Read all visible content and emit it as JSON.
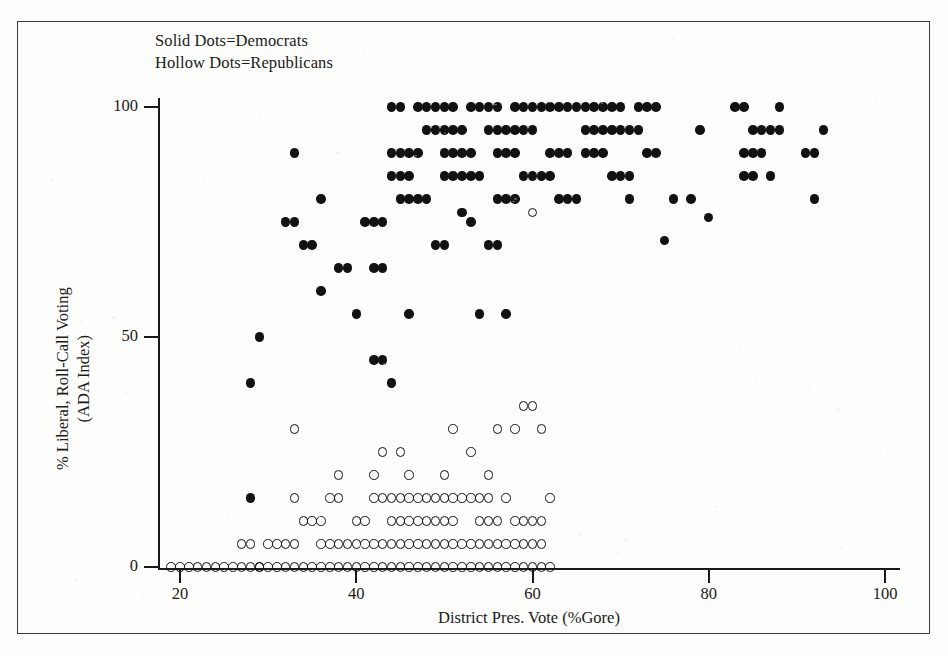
{
  "legend": {
    "line1": "Solid Dots=Democrats",
    "line2": "Hollow Dots=Republicans"
  },
  "axes": {
    "x_title": "District Pres. Vote (%Gore)",
    "y_title_line1": "% Liberal, Roll-Call Voting",
    "y_title_line2": "(ADA Index)",
    "x_ticks": [
      "20",
      "40",
      "60",
      "80",
      "100"
    ],
    "y_ticks": [
      "0",
      "50",
      "100"
    ]
  },
  "colors": {
    "ink": "#121210",
    "frame": "#3a3a38",
    "paper": "#fdfdfc"
  },
  "chart_data": {
    "type": "scatter",
    "title": "",
    "xlabel": "District Pres. Vote (%Gore)",
    "ylabel": "% Liberal, Roll-Call Voting (ADA Index)",
    "xlim": [
      17,
      102
    ],
    "ylim": [
      -4,
      106
    ],
    "xticks": [
      20,
      40,
      60,
      80,
      100
    ],
    "yticks": [
      0,
      50,
      100
    ],
    "grid": false,
    "legend_position": "top-left-inside",
    "series": [
      {
        "name": "Democrats",
        "marker": "filled-circle",
        "color": "#121210",
        "points": [
          [
            28,
            40
          ],
          [
            29,
            50
          ],
          [
            28,
            15
          ],
          [
            32,
            75
          ],
          [
            33,
            75
          ],
          [
            34,
            70
          ],
          [
            35,
            70
          ],
          [
            36,
            80
          ],
          [
            33,
            90
          ],
          [
            36,
            60
          ],
          [
            38,
            65
          ],
          [
            39,
            65
          ],
          [
            40,
            55
          ],
          [
            41,
            75
          ],
          [
            42,
            75
          ],
          [
            43,
            75
          ],
          [
            42,
            45
          ],
          [
            43,
            45
          ],
          [
            44,
            40
          ],
          [
            42,
            65
          ],
          [
            43,
            65
          ],
          [
            44,
            85
          ],
          [
            45,
            85
          ],
          [
            46,
            85
          ],
          [
            44,
            90
          ],
          [
            45,
            90
          ],
          [
            46,
            90
          ],
          [
            47,
            90
          ],
          [
            45,
            80
          ],
          [
            46,
            80
          ],
          [
            47,
            80
          ],
          [
            48,
            80
          ],
          [
            44,
            100
          ],
          [
            45,
            100
          ],
          [
            47,
            100
          ],
          [
            48,
            100
          ],
          [
            49,
            70
          ],
          [
            50,
            70
          ],
          [
            46,
            55
          ],
          [
            48,
            95
          ],
          [
            49,
            95
          ],
          [
            50,
            95
          ],
          [
            51,
            95
          ],
          [
            52,
            95
          ],
          [
            50,
            85
          ],
          [
            51,
            85
          ],
          [
            52,
            85
          ],
          [
            50,
            90
          ],
          [
            51,
            90
          ],
          [
            52,
            90
          ],
          [
            53,
            90
          ],
          [
            49,
            100
          ],
          [
            50,
            100
          ],
          [
            51,
            100
          ],
          [
            53,
            100
          ],
          [
            54,
            100
          ],
          [
            55,
            100
          ],
          [
            53,
            85
          ],
          [
            54,
            85
          ],
          [
            52,
            77
          ],
          [
            53,
            75
          ],
          [
            55,
            70
          ],
          [
            56,
            70
          ],
          [
            54,
            55
          ],
          [
            57,
            55
          ],
          [
            56,
            80
          ],
          [
            57,
            80
          ],
          [
            58,
            80
          ],
          [
            55,
            95
          ],
          [
            56,
            95
          ],
          [
            57,
            95
          ],
          [
            58,
            95
          ],
          [
            59,
            95
          ],
          [
            60,
            95
          ],
          [
            56,
            90
          ],
          [
            57,
            90
          ],
          [
            58,
            90
          ],
          [
            56,
            100
          ],
          [
            58,
            100
          ],
          [
            59,
            100
          ],
          [
            60,
            100
          ],
          [
            61,
            100
          ],
          [
            62,
            100
          ],
          [
            63,
            100
          ],
          [
            64,
            100
          ],
          [
            65,
            100
          ],
          [
            59,
            85
          ],
          [
            60,
            85
          ],
          [
            61,
            85
          ],
          [
            62,
            85
          ],
          [
            62,
            90
          ],
          [
            63,
            90
          ],
          [
            64,
            90
          ],
          [
            63,
            80
          ],
          [
            64,
            80
          ],
          [
            65,
            80
          ],
          [
            66,
            100
          ],
          [
            67,
            100
          ],
          [
            68,
            100
          ],
          [
            69,
            100
          ],
          [
            70,
            100
          ],
          [
            66,
            95
          ],
          [
            67,
            95
          ],
          [
            68,
            95
          ],
          [
            69,
            95
          ],
          [
            70,
            95
          ],
          [
            71,
            95
          ],
          [
            72,
            95
          ],
          [
            66,
            90
          ],
          [
            67,
            90
          ],
          [
            68,
            90
          ],
          [
            69,
            85
          ],
          [
            70,
            85
          ],
          [
            71,
            85
          ],
          [
            72,
            100
          ],
          [
            73,
            100
          ],
          [
            74,
            100
          ],
          [
            73,
            90
          ],
          [
            74,
            90
          ],
          [
            71,
            80
          ],
          [
            75,
            71
          ],
          [
            76,
            80
          ],
          [
            78,
            80
          ],
          [
            79,
            95
          ],
          [
            80,
            76
          ],
          [
            83,
            100
          ],
          [
            84,
            100
          ],
          [
            85,
            95
          ],
          [
            86,
            95
          ],
          [
            87,
            95
          ],
          [
            88,
            95
          ],
          [
            84,
            90
          ],
          [
            85,
            90
          ],
          [
            86,
            90
          ],
          [
            84,
            85
          ],
          [
            85,
            85
          ],
          [
            87,
            85
          ],
          [
            88,
            100
          ],
          [
            91,
            90
          ],
          [
            92,
            90
          ],
          [
            93,
            95
          ],
          [
            92,
            80
          ]
        ]
      },
      {
        "name": "Republicans",
        "marker": "hollow-circle",
        "color": "#121210",
        "points": [
          [
            19,
            0
          ],
          [
            22,
            0
          ],
          [
            23,
            0
          ],
          [
            24,
            0
          ],
          [
            25,
            0
          ],
          [
            26,
            0
          ],
          [
            27,
            5
          ],
          [
            28,
            5
          ],
          [
            27,
            0
          ],
          [
            28,
            0
          ],
          [
            29,
            0
          ],
          [
            30,
            0
          ],
          [
            31,
            0
          ],
          [
            32,
            0
          ],
          [
            33,
            0
          ],
          [
            34,
            0
          ],
          [
            33,
            5
          ],
          [
            34,
            10
          ],
          [
            35,
            10
          ],
          [
            33,
            15
          ],
          [
            35,
            0
          ],
          [
            36,
            0
          ],
          [
            37,
            0
          ],
          [
            38,
            0
          ],
          [
            36,
            10
          ],
          [
            37,
            15
          ],
          [
            38,
            20
          ],
          [
            39,
            0
          ],
          [
            40,
            0
          ],
          [
            41,
            0
          ],
          [
            42,
            0
          ],
          [
            43,
            0
          ],
          [
            40,
            10
          ],
          [
            41,
            10
          ],
          [
            42,
            15
          ],
          [
            43,
            15
          ],
          [
            44,
            15
          ],
          [
            43,
            25
          ],
          [
            44,
            0
          ],
          [
            45,
            0
          ],
          [
            46,
            0
          ],
          [
            47,
            0
          ],
          [
            48,
            0
          ],
          [
            44,
            10
          ],
          [
            45,
            10
          ],
          [
            46,
            10
          ],
          [
            47,
            10
          ],
          [
            48,
            10
          ],
          [
            45,
            15
          ],
          [
            46,
            15
          ],
          [
            47,
            15
          ],
          [
            48,
            15
          ],
          [
            46,
            20
          ],
          [
            49,
            0
          ],
          [
            50,
            0
          ],
          [
            51,
            0
          ],
          [
            52,
            0
          ],
          [
            53,
            0
          ],
          [
            49,
            10
          ],
          [
            50,
            10
          ],
          [
            51,
            10
          ],
          [
            49,
            15
          ],
          [
            50,
            15
          ],
          [
            51,
            15
          ],
          [
            52,
            15
          ],
          [
            50,
            20
          ],
          [
            51,
            30
          ],
          [
            53,
            25
          ],
          [
            54,
            0
          ],
          [
            55,
            0
          ],
          [
            56,
            0
          ],
          [
            57,
            0
          ],
          [
            54,
            10
          ],
          [
            55,
            10
          ],
          [
            56,
            10
          ],
          [
            53,
            15
          ],
          [
            54,
            15
          ],
          [
            55,
            15
          ],
          [
            57,
            15
          ],
          [
            55,
            20
          ],
          [
            58,
            0
          ],
          [
            59,
            0
          ],
          [
            60,
            0
          ],
          [
            58,
            10
          ],
          [
            59,
            10
          ],
          [
            60,
            10
          ],
          [
            59,
            35
          ],
          [
            60,
            35
          ],
          [
            58,
            30
          ],
          [
            61,
            0
          ],
          [
            62,
            0
          ],
          [
            61,
            10
          ],
          [
            62,
            15
          ],
          [
            61,
            30
          ],
          [
            33,
            30
          ],
          [
            60,
            77
          ],
          [
            56,
            30
          ],
          [
            45,
            25
          ],
          [
            42,
            20
          ],
          [
            38,
            15
          ],
          [
            29,
            0
          ],
          [
            30,
            5
          ],
          [
            31,
            5
          ],
          [
            32,
            5
          ],
          [
            39,
            5
          ],
          [
            40,
            5
          ],
          [
            41,
            5
          ],
          [
            42,
            5
          ],
          [
            43,
            5
          ],
          [
            44,
            5
          ],
          [
            45,
            5
          ],
          [
            46,
            5
          ],
          [
            47,
            5
          ],
          [
            48,
            5
          ],
          [
            49,
            5
          ],
          [
            50,
            5
          ],
          [
            51,
            5
          ],
          [
            52,
            5
          ],
          [
            53,
            5
          ],
          [
            54,
            5
          ],
          [
            55,
            5
          ],
          [
            56,
            5
          ],
          [
            57,
            5
          ],
          [
            58,
            5
          ],
          [
            59,
            5
          ],
          [
            60,
            5
          ],
          [
            61,
            5
          ],
          [
            36,
            5
          ],
          [
            37,
            5
          ],
          [
            38,
            5
          ],
          [
            20,
            0
          ],
          [
            21,
            0
          ]
        ]
      }
    ]
  }
}
